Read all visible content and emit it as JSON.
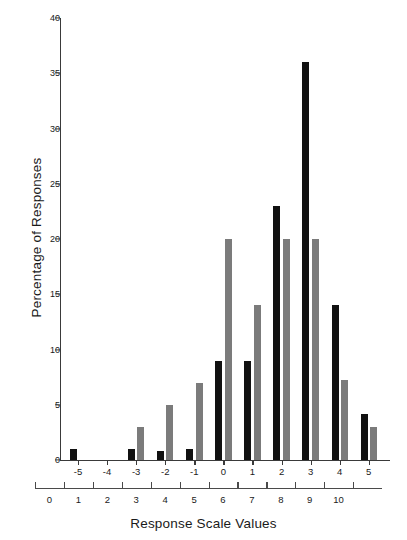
{
  "chart_data": {
    "type": "bar",
    "title": "",
    "xlabel": "Response Scale Values",
    "ylabel": "Percentage of Responses",
    "ylim": [
      0,
      40
    ],
    "yticks": [
      0,
      5,
      10,
      15,
      20,
      25,
      30,
      35,
      40
    ],
    "grid": false,
    "legend": "none",
    "categories": [
      "-5",
      "-4",
      "-3",
      "-2",
      "-1",
      "0",
      "1",
      "2",
      "3",
      "4",
      "5"
    ],
    "secondary_axis": {
      "label": "Response Scale Values",
      "ticks": [
        "0",
        "1",
        "2",
        "3",
        "4",
        "5",
        "6",
        "7",
        "8",
        "9",
        "10"
      ]
    },
    "series": [
      {
        "name": "black",
        "color": "#111111",
        "values": [
          1,
          0,
          1,
          0.8,
          1,
          9,
          9,
          23,
          36,
          14,
          4.2
        ]
      },
      {
        "name": "gray",
        "color": "#7b7b7b",
        "values": [
          0,
          0,
          3,
          5,
          7,
          20,
          14,
          20,
          20,
          7.2,
          3
        ]
      }
    ]
  },
  "axes": {
    "y_title": "Percentage of Responses",
    "x_title": "Response Scale Values"
  }
}
